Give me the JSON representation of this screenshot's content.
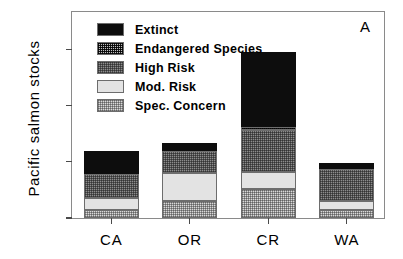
{
  "panel_label": "A",
  "axis": {
    "ylabel": "Pacific salmon stocks",
    "yticks": [
      "0",
      "50",
      "100",
      "150"
    ],
    "xticks": [
      "CA",
      "OR",
      "CR",
      "WA"
    ]
  },
  "legend": {
    "items": [
      {
        "label": "Extinct",
        "swatch": "extinct-swatch",
        "color": "#0d0d0d"
      },
      {
        "label": "Endangered Species",
        "swatch": "endangered-swatch",
        "color": "#3a3a3a"
      },
      {
        "label": "High Risk",
        "swatch": "high-risk-swatch",
        "color": "#8d8d8d"
      },
      {
        "label": "Mod. Risk",
        "swatch": "mod-risk-swatch",
        "color": "#e3e3e3"
      },
      {
        "label": "Spec. Concern",
        "swatch": "spec-concern-swatch",
        "color": "#d9d9d9"
      }
    ]
  },
  "chart_data": {
    "type": "bar",
    "title": "",
    "subtitle": "",
    "xlabel": "",
    "ylabel": "Pacific salmon stocks",
    "categories": [
      "CA",
      "OR",
      "CR",
      "WA"
    ],
    "ylim": [
      0,
      185
    ],
    "ytick_values": [
      0,
      50,
      100,
      150
    ],
    "grid": false,
    "stacked": true,
    "legend_position": "upper-left",
    "annotations": [
      "A"
    ],
    "series": [
      {
        "name": "Spec. Concern",
        "values": [
          7,
          15,
          26,
          7
        ]
      },
      {
        "name": "Mod. Risk",
        "values": [
          11,
          25,
          15,
          8
        ]
      },
      {
        "name": "High Risk",
        "values": [
          21,
          20,
          37,
          29
        ]
      },
      {
        "name": "Endangered Species",
        "values": [
          0,
          0,
          3,
          0
        ]
      },
      {
        "name": "Extinct",
        "values": [
          21,
          7,
          67,
          5
        ]
      }
    ],
    "totals": [
      60,
      67,
      148,
      49
    ]
  }
}
